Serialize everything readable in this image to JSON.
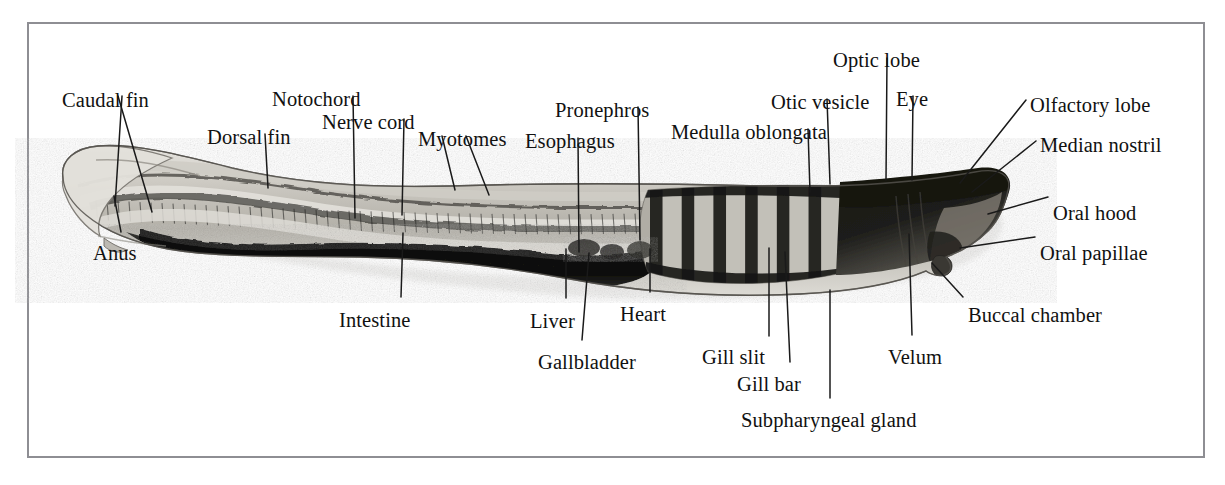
{
  "figure": {
    "kind": "labeled-anatomical-photomicrograph",
    "frame_color": "#8e8e93",
    "background_color": "#ffffff",
    "label_color": "#111111",
    "leader_color": "#1a1a1a"
  },
  "labels": [
    {
      "id": "caudal-fin",
      "text": "Caudal fin",
      "x": 62,
      "y": 90,
      "anchor": "start"
    },
    {
      "id": "anus",
      "text": "Anus",
      "x": 93,
      "y": 243,
      "anchor": "start"
    },
    {
      "id": "dorsal-fin",
      "text": "Dorsal fin",
      "x": 207,
      "y": 127,
      "anchor": "start"
    },
    {
      "id": "notochord",
      "text": "Notochord",
      "x": 272,
      "y": 89,
      "anchor": "start"
    },
    {
      "id": "nerve-cord",
      "text": "Nerve cord",
      "x": 322,
      "y": 112,
      "anchor": "start"
    },
    {
      "id": "myotomes",
      "text": "Myotomes",
      "x": 418,
      "y": 129,
      "anchor": "start"
    },
    {
      "id": "intestine",
      "text": "Intestine",
      "x": 339,
      "y": 310,
      "anchor": "start"
    },
    {
      "id": "esophagus",
      "text": "Esophagus",
      "x": 525,
      "y": 131,
      "anchor": "start"
    },
    {
      "id": "pronephros",
      "text": "Pronephros",
      "x": 555,
      "y": 100,
      "anchor": "start"
    },
    {
      "id": "liver",
      "text": "Liver",
      "x": 530,
      "y": 311,
      "anchor": "start"
    },
    {
      "id": "gallbladder",
      "text": "Gallbladder",
      "x": 538,
      "y": 352,
      "anchor": "start"
    },
    {
      "id": "heart",
      "text": "Heart",
      "x": 620,
      "y": 304,
      "anchor": "start"
    },
    {
      "id": "medulla-oblongata",
      "text": "Medulla oblongata",
      "x": 671,
      "y": 122,
      "anchor": "start"
    },
    {
      "id": "otic-vesicle",
      "text": "Otic vesicle",
      "x": 771,
      "y": 92,
      "anchor": "start"
    },
    {
      "id": "optic-lobe",
      "text": "Optic lobe",
      "x": 833,
      "y": 50,
      "anchor": "start"
    },
    {
      "id": "eye",
      "text": "Eye",
      "x": 896,
      "y": 89,
      "anchor": "start"
    },
    {
      "id": "olfactory-lobe",
      "text": "Olfactory lobe",
      "x": 1030,
      "y": 95,
      "anchor": "start"
    },
    {
      "id": "median-nostril",
      "text": "Median nostril",
      "x": 1040,
      "y": 135,
      "anchor": "start"
    },
    {
      "id": "oral-hood",
      "text": "Oral hood",
      "x": 1053,
      "y": 203,
      "anchor": "start"
    },
    {
      "id": "oral-papillae",
      "text": "Oral papillae",
      "x": 1040,
      "y": 243,
      "anchor": "start"
    },
    {
      "id": "buccal-chamber",
      "text": "Buccal chamber",
      "x": 968,
      "y": 305,
      "anchor": "start"
    },
    {
      "id": "velum",
      "text": "Velum",
      "x": 888,
      "y": 347,
      "anchor": "start"
    },
    {
      "id": "gill-slit",
      "text": "Gill slit",
      "x": 702,
      "y": 347,
      "anchor": "start"
    },
    {
      "id": "gill-bar",
      "text": "Gill bar",
      "x": 737,
      "y": 374,
      "anchor": "start"
    },
    {
      "id": "subpharyngeal-gland",
      "text": "Subpharyngeal gland",
      "x": 741,
      "y": 410,
      "anchor": "start"
    }
  ],
  "leaders": [
    {
      "id": "caudal-fin-leader-a",
      "points": "118,96 152,212"
    },
    {
      "id": "caudal-fin-leader-b",
      "points": "122,96 115,206"
    },
    {
      "id": "anus-leader",
      "points": "121,232 114,196"
    },
    {
      "id": "dorsal-fin-leader",
      "points": "265,134 268,188"
    },
    {
      "id": "notochord-leader",
      "points": "353,96 355,218"
    },
    {
      "id": "nerve-cord-leader",
      "points": "404,119 402,215"
    },
    {
      "id": "myotomes-leader-a",
      "points": "442,136 455,190"
    },
    {
      "id": "myotomes-leader-b",
      "points": "466,136 489,195"
    },
    {
      "id": "intestine-leader",
      "points": "401,297 403,233"
    },
    {
      "id": "esophagus-leader",
      "points": "578,138 579,252"
    },
    {
      "id": "pronephros-leader",
      "points": "638,107 640,240"
    },
    {
      "id": "liver-leader",
      "points": "566,298 566,249"
    },
    {
      "id": "gallbladder-leader",
      "points": "582,340 589,253"
    },
    {
      "id": "heart-leader",
      "points": "650,292 650,249"
    },
    {
      "id": "medulla-leader",
      "points": "808,129 810,192"
    },
    {
      "id": "otic-vesicle-leader",
      "points": "827,99 830,184"
    },
    {
      "id": "optic-lobe-leader",
      "points": "887,58 886,180"
    },
    {
      "id": "eye-leader",
      "points": "913,96 912,180"
    },
    {
      "id": "olfactory-leader",
      "points": "1026,100 960,183"
    },
    {
      "id": "median-nostril-leader",
      "points": "1036,141 972,192"
    },
    {
      "id": "oral-hood-leader",
      "points": "1048,197 988,214"
    },
    {
      "id": "oral-papillae-leader",
      "points": "1035,237 960,248"
    },
    {
      "id": "buccal-leader",
      "points": "963,297 932,263"
    },
    {
      "id": "velum-leader",
      "points": "912,335 909,234"
    },
    {
      "id": "gill-slit-leader",
      "points": "769,336 769,248"
    },
    {
      "id": "gill-bar-leader",
      "points": "790,362 785,252"
    },
    {
      "id": "subpharyngeal-leader",
      "points": "830,398 830,290"
    }
  ],
  "specimen": {
    "description": "whole-mount ammocoete larva, head at right, tail at left",
    "tint_light": "#d9d7d1",
    "tint_mid": "#9b9890",
    "tint_dark": "#2a2a28",
    "tint_black": "#121212",
    "gill_bar_count": 7
  }
}
